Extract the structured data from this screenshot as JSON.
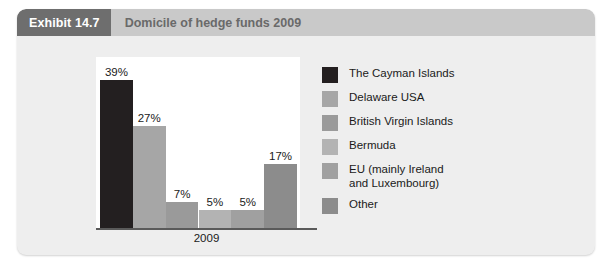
{
  "exhibit": {
    "tag": "Exhibit 14.7",
    "title": "Domicile of hedge funds 2009"
  },
  "colors": {
    "card_background": "#eeeeee",
    "header_band": "#c9c9c9",
    "tag_background": "#6e6e6e",
    "tag_text": "#ffffff",
    "title_text": "#6a6a6a",
    "plot_background": "#ffffff",
    "axis_line": "#5a5a5a",
    "label_text": "#1a1a1a"
  },
  "chart_data": {
    "type": "bar",
    "title": "Domicile of hedge funds 2009",
    "xlabel": "2009",
    "ylabel": "",
    "ylim": [
      0,
      45
    ],
    "grid": false,
    "legend_position": "right",
    "categories": [
      "The Cayman Islands",
      "Delaware USA",
      "British Virgin Islands",
      "Bermuda",
      "EU (mainly Ireland and Luxembourg)",
      "Other"
    ],
    "values": [
      39,
      27,
      7,
      5,
      5,
      17
    ],
    "data_labels": [
      "39%",
      "27%",
      "7%",
      "5%",
      "5%",
      "17%"
    ],
    "bar_colors": [
      "#231f20",
      "#a6a6a6",
      "#9a9a9a",
      "#b3b3b3",
      "#a0a0a0",
      "#8c8c8c"
    ],
    "x_tick_labels": [
      "2009"
    ]
  },
  "legend": {
    "items": [
      {
        "label": "The Cayman Islands",
        "color": "#231f20"
      },
      {
        "label": "Delaware USA",
        "color": "#a6a6a6"
      },
      {
        "label": "British Virgin Islands",
        "color": "#9a9a9a"
      },
      {
        "label": "Bermuda",
        "color": "#b3b3b3"
      },
      {
        "label": "EU (mainly Ireland\nand Luxembourg)",
        "color": "#a0a0a0"
      },
      {
        "label": "Other",
        "color": "#8c8c8c"
      }
    ]
  }
}
